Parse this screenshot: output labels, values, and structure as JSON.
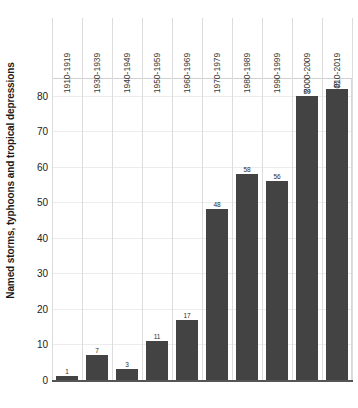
{
  "chart_data": {
    "type": "bar",
    "title": "",
    "xlabel": "",
    "ylabel": "Named storms, typhoons and tropical depressions",
    "ylim": [
      0,
      85
    ],
    "yticks": [
      0,
      10,
      20,
      30,
      40,
      50,
      60,
      70,
      80
    ],
    "grid": true,
    "legend": false,
    "bar_color": "#434343",
    "categories": [
      "1910-1919",
      "1930-1939",
      "1940-1949",
      "1950-1959",
      "1960-1969",
      "1970-1979",
      "1980-1989",
      "1990-1999",
      "2000-2009",
      "2010-2019"
    ],
    "values": [
      1,
      7,
      3,
      11,
      17,
      48,
      58,
      56,
      80,
      82
    ],
    "value_labels": [
      "1",
      "7",
      "3",
      "11",
      "17",
      "48",
      "58",
      "56",
      "80",
      "82"
    ]
  }
}
